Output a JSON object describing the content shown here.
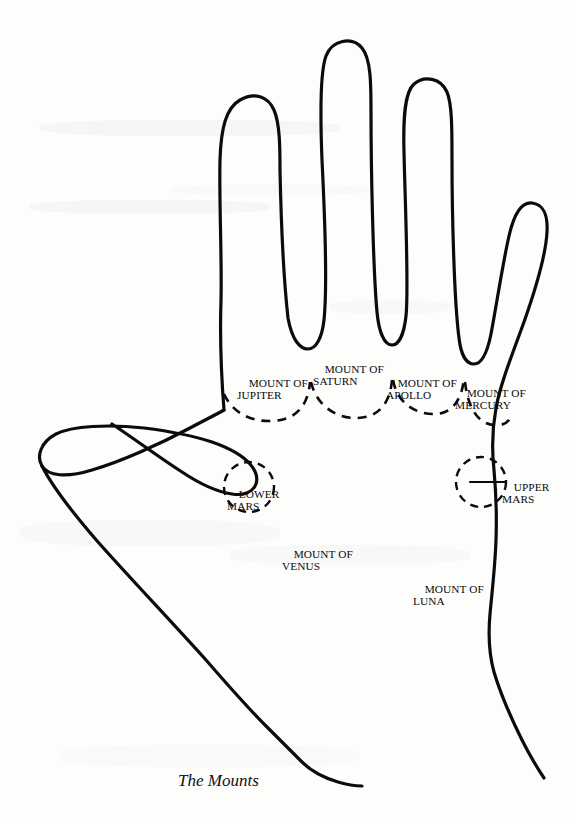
{
  "figure": {
    "caption": "The Mounts",
    "ink_color": "#0b0b0b",
    "paper_color": "#fdfdfc"
  },
  "labels": {
    "jupiter": {
      "line1": "MOUNT OF",
      "line2": "JUPITER"
    },
    "saturn": {
      "line1": "MOUNT OF",
      "line2": "SATURN"
    },
    "apollo": {
      "line1": "MOUNT OF",
      "line2": "APOLLO"
    },
    "mercury": {
      "line1": "MOUNT OF",
      "line2": "MERCURY"
    },
    "lower_mars": {
      "line1": "LOWER",
      "line2": "MARS"
    },
    "upper_mars": {
      "line1": "UPPER",
      "line2": "MARS"
    },
    "venus": {
      "line1": "MOUNT OF",
      "line2": "VENUS"
    },
    "luna": {
      "line1": "MOUNT OF",
      "line2": "LUNA"
    }
  },
  "geometry": {
    "hand_outline_path": "M 224 410 C 221 372 220 330 221 300 C 222 258 219 200 220 160 C 221 128 226 108 240 100 C 254 92 268 96 274 110 C 280 124 280 148 280 170 C 281 218 284 282 288 318 C 292 340 300 349 308 349 C 316 349 322 338 324 320 C 327 292 325 220 322 160 C 320 110 320 72 326 56 C 332 40 352 36 362 48 C 371 59 371 84 371 112 C 371 166 373 268 377 312 C 379 334 385 345 392 345 C 399 345 404 334 406 316 C 409 288 405 200 404 152 C 403 116 405 92 414 84 C 424 75 441 78 447 92 C 452 104 452 128 452 160 C 452 210 454 300 459 338 C 461 356 467 364 474 364 C 481 364 487 354 491 334 C 497 302 503 262 509 236 C 514 214 522 202 532 203 C 543 204 548 215 547 232 C 546 252 536 288 524 322 C 510 360 500 386 496 408 C 492 430 492 452 494 470 C 496 492 497 512 496 540 C 495 568 492 592 490 614 C 488 636 489 654 494 672 C 500 692 510 716 522 740 C 532 760 540 772 544 778",
    "thumb_outline_path": "M 224 410 C 217 414 205 420 190 428 C 160 444 120 462 92 470 C 66 478 48 476 42 466 C 36 456 41 442 56 434 C 72 426 108 424 144 428 C 168 431 194 436 212 442 C 232 449 243 456 250 464 C 256 471 258 478 256 484 C 253 492 244 496 232 494 C 218 492 200 484 182 472 C 160 458 136 440 112 424",
    "thumb_lower_path": "M 42 466 C 52 486 72 512 98 542 C 130 578 170 620 206 660 C 232 690 252 712 266 726 C 280 740 292 752 302 762 C 312 772 325 778 338 782 C 348 785 356 786 362 786",
    "mount_arcs": [
      {
        "name": "jupiter-arc",
        "d": "M 224 394 C 232 412 250 422 272 421 C 296 420 308 406 310 382"
      },
      {
        "name": "saturn-arc",
        "d": "M 311 382 C 316 404 334 418 356 418 C 378 418 390 404 392 380"
      },
      {
        "name": "apollo-arc",
        "d": "M 393 380 C 397 402 414 414 434 414 C 452 414 462 400 464 378"
      },
      {
        "name": "mercury-arc",
        "d": "M 465 382 C 468 408 478 424 494 425 C 504 426 509 422 511 416"
      }
    ],
    "mount_circles": [
      {
        "name": "lower-mars-circle",
        "cx": 249,
        "cy": 487,
        "r": 25
      },
      {
        "name": "upper-mars-circle",
        "cx": 481,
        "cy": 482,
        "r": 25
      }
    ],
    "leader_lines": [
      {
        "name": "upper-mars-leader",
        "x1": 470,
        "y1": 482,
        "x2": 505,
        "y2": 482
      }
    ]
  },
  "label_positions": {
    "jupiter": {
      "left": 237,
      "top": 366,
      "align": "left"
    },
    "saturn": {
      "left": 313,
      "top": 352,
      "align": "left"
    },
    "apollo": {
      "left": 386,
      "top": 366,
      "align": "left"
    },
    "mercury": {
      "left": 455,
      "top": 376,
      "align": "left"
    },
    "lower_mars": {
      "left": 227,
      "top": 477,
      "align": "left"
    },
    "upper_mars": {
      "left": 502,
      "top": 470,
      "align": "left"
    },
    "venus": {
      "left": 282,
      "top": 537,
      "align": "left"
    },
    "luna": {
      "left": 413,
      "top": 572,
      "align": "left"
    },
    "caption": {
      "left": 178,
      "top": 771,
      "align": "left"
    }
  }
}
